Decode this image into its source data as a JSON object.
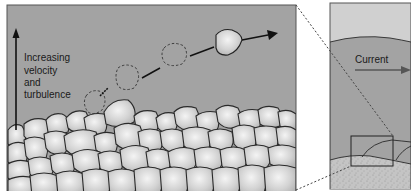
{
  "figure": {
    "left_panel": {
      "axis_label_lines": [
        "Increasing",
        "velocity",
        "and",
        "turbulence"
      ],
      "arrow_direction": "up"
    },
    "right_panel": {
      "current_label": "Current",
      "arrow_direction": "right"
    },
    "colors": {
      "water": "#9e9e9e",
      "water_light": "#c9c9c9",
      "rock_fill": "#d4d4d4",
      "rock_highlight": "#f2f2f2",
      "outline": "#2a2a2a",
      "sand": "#bdbdbd",
      "background": "#ffffff"
    }
  }
}
